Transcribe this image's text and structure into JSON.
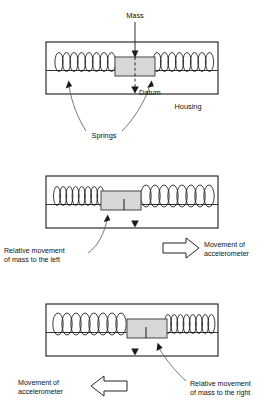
{
  "diagram": {
    "colors": {
      "line": "#1a1a1a",
      "mass_fill": "#d8d8d8",
      "background": "#ffffff"
    },
    "panels": [
      {
        "id": "rest",
        "state_label": "At rest",
        "mass_offset": 0,
        "labels": {
          "mass": "Mass",
          "datum": "Datum",
          "springs": "Springs",
          "housing": "Housing"
        }
      },
      {
        "id": "accelerating-right",
        "state_label": "Accelerometer moving right",
        "mass_offset": -14,
        "labels": {
          "relative": "Relative movement",
          "relative2": "of mass to the left",
          "movement": "Movement of",
          "movement2": "accelerometer"
        },
        "arrow_direction": "right"
      },
      {
        "id": "accelerating-left",
        "state_label": "Accelerometer moving left",
        "mass_offset": 14,
        "labels": {
          "relative": "Relative movement",
          "relative2": "of mass to the right",
          "movement": "Movement of",
          "movement2": "accelerometer"
        },
        "arrow_direction": "left"
      }
    ]
  }
}
